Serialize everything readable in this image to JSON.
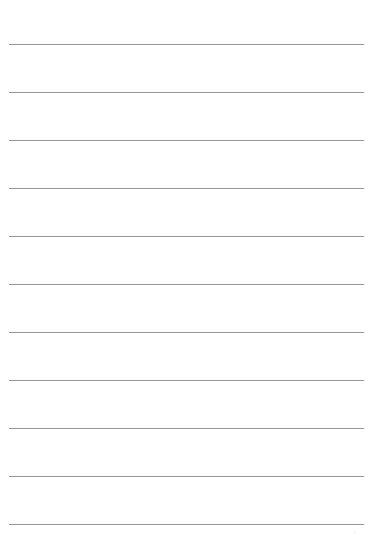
{
  "page": {
    "type": "blank lined sheet",
    "background_color": "#ffffff",
    "line_color": "#8c8c8c",
    "line_count": 11,
    "first_line_y": 44,
    "line_spacing": 48,
    "line_left": 9,
    "line_width": 355
  },
  "footer": {
    "mark": "·"
  }
}
